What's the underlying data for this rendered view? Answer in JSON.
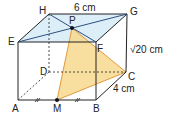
{
  "figure": {
    "type": "cuboid-geometry",
    "vertices": {
      "A": "A",
      "B": "B",
      "C": "C",
      "D": "D",
      "E": "E",
      "F": "F",
      "G": "G",
      "H": "H",
      "M": "M",
      "P": "P"
    },
    "dimensions": {
      "top": "6 cm",
      "height": "√20 cm",
      "depth": "4 cm"
    },
    "colors": {
      "edge": "#222222",
      "diagonal": "#2f4f7f",
      "top_face": "#dceef8",
      "triangle_fill": "#f7d98e",
      "triangle_edge": "#e39a3a"
    }
  }
}
